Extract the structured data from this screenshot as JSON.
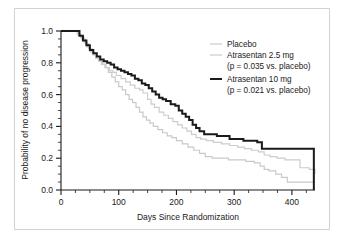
{
  "chart_data": {
    "type": "line",
    "subtype": "kaplan-meier-step",
    "title": "",
    "xlabel": "Days Since Randomization",
    "ylabel": "Probability of no disease progression",
    "xlim": [
      0,
      440
    ],
    "ylim": [
      0,
      1.0
    ],
    "xticks": [
      0,
      100,
      200,
      300,
      400
    ],
    "xtick_labels": [
      "0",
      "100",
      "200",
      "300",
      "400"
    ],
    "xminor_step": 25,
    "yticks": [
      0.0,
      0.2,
      0.4,
      0.6,
      0.8,
      1.0
    ],
    "ytick_labels": [
      "0.0",
      "0.2",
      "0.4",
      "0.6",
      "0.8",
      "1.0"
    ],
    "yminor_step": 0.05,
    "grid": false,
    "legend_position": "upper-right",
    "series": [
      {
        "name": "Placebo",
        "label": "Placebo",
        "color": "#c9c9c9",
        "width": 1.2,
        "points": [
          [
            0,
            1.0
          ],
          [
            22,
            1.0
          ],
          [
            28,
            0.98
          ],
          [
            34,
            0.96
          ],
          [
            40,
            0.93
          ],
          [
            45,
            0.9
          ],
          [
            50,
            0.87
          ],
          [
            55,
            0.85
          ],
          [
            60,
            0.83
          ],
          [
            65,
            0.81
          ],
          [
            70,
            0.79
          ],
          [
            76,
            0.77
          ],
          [
            82,
            0.74
          ],
          [
            88,
            0.71
          ],
          [
            94,
            0.68
          ],
          [
            100,
            0.65
          ],
          [
            106,
            0.63
          ],
          [
            112,
            0.6
          ],
          [
            118,
            0.57
          ],
          [
            124,
            0.55
          ],
          [
            130,
            0.52
          ],
          [
            136,
            0.49
          ],
          [
            142,
            0.46
          ],
          [
            148,
            0.44
          ],
          [
            154,
            0.42
          ],
          [
            160,
            0.4
          ],
          [
            168,
            0.38
          ],
          [
            176,
            0.36
          ],
          [
            184,
            0.34
          ],
          [
            192,
            0.33
          ],
          [
            200,
            0.31
          ],
          [
            210,
            0.29
          ],
          [
            220,
            0.27
          ],
          [
            230,
            0.25
          ],
          [
            240,
            0.23
          ],
          [
            250,
            0.21
          ],
          [
            262,
            0.2
          ],
          [
            275,
            0.2
          ],
          [
            290,
            0.19
          ],
          [
            305,
            0.19
          ],
          [
            320,
            0.18
          ],
          [
            335,
            0.17
          ],
          [
            345,
            0.15
          ],
          [
            352,
            0.13
          ],
          [
            360,
            0.12
          ],
          [
            372,
            0.1
          ],
          [
            382,
            0.08
          ],
          [
            392,
            0.05
          ],
          [
            404,
            0.05
          ],
          [
            440,
            0.05
          ]
        ]
      },
      {
        "name": "Atrasentan 2.5 mg",
        "label": "Atrasentan 2.5 mg",
        "sublabel": "(p = 0.035 vs. placebo)",
        "pvalue": "0.035",
        "color": "#cccccc",
        "width": 1.2,
        "points": [
          [
            0,
            1.0
          ],
          [
            24,
            1.0
          ],
          [
            30,
            0.97
          ],
          [
            36,
            0.95
          ],
          [
            42,
            0.92
          ],
          [
            48,
            0.89
          ],
          [
            54,
            0.86
          ],
          [
            60,
            0.84
          ],
          [
            66,
            0.81
          ],
          [
            72,
            0.79
          ],
          [
            78,
            0.77
          ],
          [
            84,
            0.75
          ],
          [
            90,
            0.74
          ],
          [
            96,
            0.72
          ],
          [
            104,
            0.7
          ],
          [
            112,
            0.68
          ],
          [
            120,
            0.66
          ],
          [
            128,
            0.64
          ],
          [
            136,
            0.63
          ],
          [
            142,
            0.61
          ],
          [
            150,
            0.57
          ],
          [
            156,
            0.54
          ],
          [
            162,
            0.52
          ],
          [
            170,
            0.49
          ],
          [
            178,
            0.47
          ],
          [
            186,
            0.45
          ],
          [
            194,
            0.43
          ],
          [
            202,
            0.41
          ],
          [
            210,
            0.39
          ],
          [
            218,
            0.37
          ],
          [
            226,
            0.35
          ],
          [
            234,
            0.33
          ],
          [
            242,
            0.32
          ],
          [
            252,
            0.31
          ],
          [
            264,
            0.3
          ],
          [
            278,
            0.29
          ],
          [
            292,
            0.28
          ],
          [
            306,
            0.27
          ],
          [
            318,
            0.26
          ],
          [
            330,
            0.25
          ],
          [
            342,
            0.24
          ],
          [
            352,
            0.22
          ],
          [
            362,
            0.21
          ],
          [
            374,
            0.2
          ],
          [
            388,
            0.19
          ],
          [
            400,
            0.19
          ],
          [
            414,
            0.14
          ],
          [
            430,
            0.13
          ],
          [
            440,
            0.1
          ]
        ]
      },
      {
        "name": "Atrasentan 10 mg",
        "label": "Atrasentan 10 mg",
        "sublabel": "(p = 0.021 vs. placebo)",
        "pvalue": "0.021",
        "color": "#1a1a1a",
        "width": 2.0,
        "points": [
          [
            0,
            1.0
          ],
          [
            26,
            1.0
          ],
          [
            32,
            0.97
          ],
          [
            38,
            0.94
          ],
          [
            44,
            0.91
          ],
          [
            50,
            0.88
          ],
          [
            56,
            0.86
          ],
          [
            62,
            0.84
          ],
          [
            68,
            0.82
          ],
          [
            74,
            0.81
          ],
          [
            80,
            0.8
          ],
          [
            86,
            0.79
          ],
          [
            92,
            0.77
          ],
          [
            98,
            0.76
          ],
          [
            104,
            0.75
          ],
          [
            110,
            0.74
          ],
          [
            116,
            0.73
          ],
          [
            122,
            0.72
          ],
          [
            128,
            0.7
          ],
          [
            134,
            0.69
          ],
          [
            140,
            0.67
          ],
          [
            146,
            0.66
          ],
          [
            152,
            0.64
          ],
          [
            158,
            0.62
          ],
          [
            164,
            0.6
          ],
          [
            170,
            0.58
          ],
          [
            176,
            0.57
          ],
          [
            182,
            0.56
          ],
          [
            190,
            0.54
          ],
          [
            198,
            0.53
          ],
          [
            204,
            0.5
          ],
          [
            210,
            0.48
          ],
          [
            216,
            0.46
          ],
          [
            222,
            0.44
          ],
          [
            228,
            0.41
          ],
          [
            234,
            0.39
          ],
          [
            240,
            0.37
          ],
          [
            248,
            0.35
          ],
          [
            258,
            0.35
          ],
          [
            270,
            0.34
          ],
          [
            282,
            0.34
          ],
          [
            292,
            0.32
          ],
          [
            304,
            0.32
          ],
          [
            316,
            0.31
          ],
          [
            328,
            0.31
          ],
          [
            340,
            0.3
          ],
          [
            348,
            0.26
          ],
          [
            380,
            0.26
          ],
          [
            410,
            0.26
          ],
          [
            438,
            0.26
          ],
          [
            438,
            0.0
          ]
        ]
      }
    ],
    "legend_entries": [
      {
        "label": "Placebo",
        "sublabel": "",
        "color": "#c9c9c9",
        "thick": false
      },
      {
        "label": "Atrasentan 2.5 mg",
        "sublabel": "(p = 0.035 vs. placebo)",
        "color": "#cccccc",
        "thick": false
      },
      {
        "label": "Atrasentan 10 mg",
        "sublabel": "(p = 0.021 vs. placebo)",
        "color": "#1a1a1a",
        "thick": true
      }
    ]
  },
  "figure": {
    "border_color": "#d2d2d2",
    "background": "#ffffff",
    "axis_color": "#1a1a1a"
  }
}
